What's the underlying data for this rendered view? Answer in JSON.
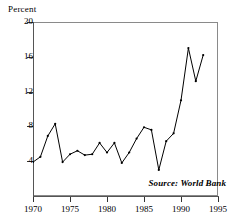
{
  "chart_data": {
    "type": "line",
    "title": "",
    "xlabel": "",
    "ylabel": "Percent",
    "xlim": [
      1970,
      1995
    ],
    "ylim": [
      0,
      20
    ],
    "grid": false,
    "legend": null,
    "xticks": [
      1970,
      1975,
      1980,
      1985,
      1990,
      1995
    ],
    "yticks": [
      4,
      8,
      12,
      16,
      20
    ],
    "annotations": [
      {
        "text": "Source: World Bank",
        "position": "bottom-right",
        "style": "bold-italic"
      }
    ],
    "series": [
      {
        "name": "Percent",
        "color": "#000000",
        "marker": "dot",
        "x": [
          1970,
          1971,
          1972,
          1973,
          1974,
          1975,
          1976,
          1977,
          1978,
          1979,
          1980,
          1981,
          1982,
          1983,
          1984,
          1985,
          1986,
          1987,
          1988,
          1989,
          1990,
          1991,
          1992,
          1993
        ],
        "values": [
          3.9,
          4.5,
          6.9,
          8.3,
          3.9,
          4.8,
          5.2,
          4.7,
          4.8,
          6.1,
          5.0,
          6.1,
          3.8,
          5.0,
          6.6,
          7.9,
          7.6,
          3.0,
          6.3,
          7.2,
          11.0,
          17.0,
          13.2,
          16.2
        ]
      }
    ]
  },
  "axes": {
    "y_title": "Percent",
    "y_tick_labels": [
      "20",
      "16",
      "12",
      "8",
      "4"
    ],
    "x_tick_labels": [
      "1970",
      "1975",
      "1980",
      "1985",
      "1990",
      "1995"
    ]
  },
  "note": {
    "source_text": "Source: World Bank"
  },
  "colors": {
    "line": "#000000",
    "frame": "#8a8a8a",
    "axis": "#555555"
  }
}
